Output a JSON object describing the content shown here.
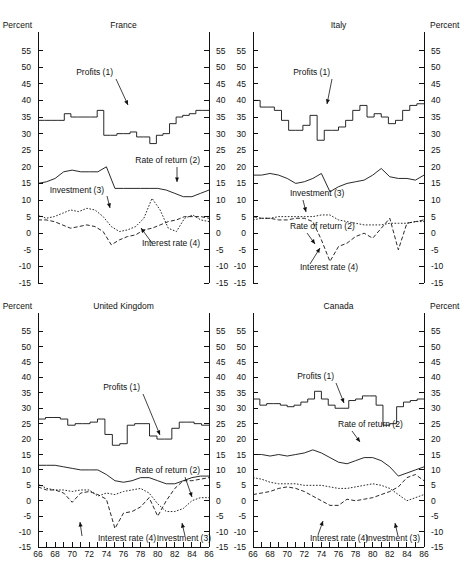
{
  "figure": {
    "left_axis_header": "Percent",
    "right_axis_header": "Percent"
  },
  "chart_data": [
    {
      "type": "line",
      "title": "France",
      "panel": "top-left",
      "xlabel": "",
      "ylabel": "Percent",
      "xlim": [
        66,
        86
      ],
      "ylim": [
        -15,
        57
      ],
      "grid": false,
      "legend_position": "inline-annotations",
      "yticks": [
        55,
        50,
        45,
        40,
        35,
        30,
        25,
        20,
        15,
        10,
        5,
        0,
        -5,
        -10,
        -15
      ],
      "xticks": [
        66,
        67,
        68,
        69,
        70,
        71,
        72,
        73,
        74,
        75,
        76,
        77,
        78,
        79,
        80,
        81,
        82,
        83,
        84,
        85,
        86
      ],
      "xticklabels": [
        "66",
        "68",
        "70",
        "72",
        "74",
        "76",
        "78",
        "80",
        "82",
        "84",
        "86"
      ],
      "x": [
        66,
        67,
        68,
        69,
        70,
        71,
        72,
        73,
        74,
        75,
        76,
        77,
        78,
        79,
        80,
        81,
        82,
        83,
        84,
        85,
        86
      ],
      "series": [
        {
          "name": "Profits (1)",
          "style": "step-solid",
          "values": [
            34,
            34,
            34,
            34,
            36,
            35,
            35,
            35,
            35,
            37,
            29.5,
            29.5,
            30,
            30,
            30.5,
            29,
            29,
            27,
            29.5,
            30,
            33,
            35,
            35.5,
            36,
            37,
            37
          ]
        },
        {
          "name": "Rate of return (2)",
          "style": "solid",
          "values": [
            15,
            15.5,
            16.5,
            18.5,
            19,
            18.5,
            18.5,
            18.5,
            20,
            13.5,
            13.5,
            13.5,
            13.5,
            13.5,
            13.5,
            13,
            12,
            11,
            11,
            12,
            13
          ]
        },
        {
          "name": "Investment (3)",
          "style": "dotted",
          "values": [
            5.5,
            4.5,
            5,
            6,
            7,
            6.5,
            7.5,
            7,
            5,
            2,
            0.5,
            1,
            2,
            4.5,
            10.5,
            7,
            1.5,
            0.5,
            4.5,
            5.5,
            4,
            3.5
          ]
        },
        {
          "name": "Interest rate (4)",
          "style": "dashed",
          "values": [
            4,
            4,
            3.5,
            2.5,
            1.5,
            2,
            2.5,
            2,
            0.5,
            -3.5,
            -2,
            -1,
            -0.5,
            1,
            1.5,
            2.5,
            3.5,
            4,
            5,
            5,
            5,
            4.5
          ]
        }
      ]
    },
    {
      "type": "line",
      "title": "Italy",
      "panel": "top-right",
      "xlabel": "",
      "ylabel": "Percent",
      "xlim": [
        66,
        86
      ],
      "ylim": [
        -15,
        57
      ],
      "grid": false,
      "legend_position": "inline-annotations",
      "yticks": [
        55,
        50,
        45,
        40,
        35,
        30,
        25,
        20,
        15,
        10,
        5,
        0,
        -5,
        -10,
        -15
      ],
      "xticks": [
        66,
        67,
        68,
        69,
        70,
        71,
        72,
        73,
        74,
        75,
        76,
        77,
        78,
        79,
        80,
        81,
        82,
        83,
        84,
        85,
        86
      ],
      "xticklabels": [
        "66",
        "68",
        "70",
        "72",
        "74",
        "76",
        "78",
        "80",
        "82",
        "84",
        "86"
      ],
      "x": [
        66,
        67,
        68,
        69,
        70,
        71,
        72,
        73,
        74,
        75,
        76,
        77,
        78,
        79,
        80,
        81,
        82,
        83,
        84,
        85,
        86
      ],
      "series": [
        {
          "name": "Profits (1)",
          "style": "step-solid",
          "values": [
            40,
            38,
            38,
            37,
            34,
            31,
            31,
            32.5,
            35.5,
            28,
            31,
            31,
            32,
            34,
            37,
            38.5,
            35,
            36,
            35,
            33,
            34,
            37,
            38.5,
            39
          ]
        },
        {
          "name": "Rate of return (2)",
          "style": "solid",
          "values": [
            17.5,
            17.5,
            18,
            17.5,
            16.5,
            15,
            15.5,
            16.5,
            18,
            12.5,
            14,
            15,
            15.5,
            16,
            17.5,
            19.5,
            17,
            16.5,
            16.5,
            16,
            17.5
          ]
        },
        {
          "name": "Investment (3)",
          "style": "dotted",
          "values": [
            4,
            4.5,
            4.5,
            5,
            5,
            5,
            5,
            5,
            5.5,
            5.5,
            4,
            3.5,
            3,
            2.5,
            2.5,
            2.5,
            3,
            3,
            3,
            3.5,
            3.5
          ]
        },
        {
          "name": "Interest rate (4)",
          "style": "dashed",
          "values": [
            5,
            4.5,
            4.5,
            4,
            4,
            4.5,
            4.5,
            3.5,
            -2,
            -8.5,
            -4,
            -3,
            -1,
            0,
            -1.5,
            1.5,
            4.5,
            -5,
            3,
            3.5,
            4
          ]
        }
      ]
    },
    {
      "type": "line",
      "title": "United Kingdom",
      "panel": "bottom-left",
      "xlabel": "",
      "ylabel": "Percent",
      "xlim": [
        66,
        86
      ],
      "ylim": [
        -15,
        57
      ],
      "grid": false,
      "legend_position": "inline-annotations",
      "yticks": [
        55,
        50,
        45,
        40,
        35,
        30,
        25,
        20,
        15,
        10,
        5,
        0,
        -5,
        -10,
        -15
      ],
      "xticks": [
        66,
        67,
        68,
        69,
        70,
        71,
        72,
        73,
        74,
        75,
        76,
        77,
        78,
        79,
        80,
        81,
        82,
        83,
        84,
        85,
        86
      ],
      "xticklabels": [
        "66",
        "68",
        "70",
        "72",
        "74",
        "76",
        "78",
        "80",
        "82",
        "84",
        "86"
      ],
      "x": [
        66,
        67,
        68,
        69,
        70,
        71,
        72,
        73,
        74,
        75,
        76,
        77,
        78,
        79,
        80,
        81,
        82,
        83,
        84,
        85,
        86
      ],
      "series": [
        {
          "name": "Profits (1)",
          "style": "step-solid",
          "values": [
            26.5,
            27,
            27,
            26.5,
            24.5,
            25,
            25,
            25.5,
            26.5,
            21.5,
            18,
            18.5,
            24.5,
            25,
            25,
            21,
            20,
            20,
            23.5,
            25.5,
            25.5,
            25,
            24.5
          ]
        },
        {
          "name": "Rate of return (2)",
          "style": "solid",
          "values": [
            11.5,
            11.5,
            11.5,
            11,
            10.5,
            10,
            10,
            10,
            8.5,
            6.5,
            6,
            6.5,
            7.5,
            7.5,
            6.5,
            5.5,
            5.5,
            6.5,
            7.5,
            8,
            8
          ]
        },
        {
          "name": "Investment (3)",
          "style": "dotted",
          "values": [
            5.5,
            4,
            3.5,
            3.5,
            3,
            3.5,
            3.5,
            1.5,
            2.5,
            2,
            3,
            3.5,
            4,
            2.5,
            -1,
            -3.5,
            -3.5,
            -2.5,
            0,
            1,
            1
          ]
        },
        {
          "name": "Interest rate (4)",
          "style": "dashed",
          "values": [
            4.5,
            3.5,
            3.5,
            2.5,
            -0.5,
            2.5,
            3,
            2,
            0.5,
            -9,
            -4,
            -3.5,
            -2,
            1,
            -5,
            0,
            4,
            6.5,
            6.5,
            7,
            7.5
          ]
        }
      ]
    },
    {
      "type": "line",
      "title": "Canada",
      "panel": "bottom-right",
      "xlabel": "",
      "ylabel": "Percent",
      "xlim": [
        66,
        86
      ],
      "ylim": [
        -15,
        57
      ],
      "grid": false,
      "legend_position": "inline-annotations",
      "yticks": [
        55,
        50,
        45,
        40,
        35,
        30,
        25,
        20,
        15,
        10,
        5,
        0,
        -5,
        -10,
        -15
      ],
      "xticks": [
        66,
        67,
        68,
        69,
        70,
        71,
        72,
        73,
        74,
        75,
        76,
        77,
        78,
        79,
        80,
        81,
        82,
        83,
        84,
        85,
        86
      ],
      "xticklabels": [
        "66",
        "68",
        "70",
        "72",
        "74",
        "76",
        "78",
        "80",
        "82",
        "84",
        "86"
      ],
      "x": [
        66,
        67,
        68,
        69,
        70,
        71,
        72,
        73,
        74,
        75,
        76,
        77,
        78,
        79,
        80,
        81,
        82,
        83,
        84,
        85,
        86
      ],
      "series": [
        {
          "name": "Profits (1)",
          "style": "step-solid",
          "values": [
            33,
            31,
            31.5,
            31.5,
            31,
            30.5,
            31,
            32,
            33,
            35.5,
            33,
            31,
            30,
            30,
            32.5,
            33,
            34,
            34,
            31,
            24.5,
            25,
            30.5,
            32,
            32.5,
            33
          ]
        },
        {
          "name": "Rate of return (2)",
          "style": "solid",
          "values": [
            15,
            15,
            14.5,
            15,
            14.5,
            15,
            15.5,
            16.5,
            15.5,
            14,
            12.5,
            12,
            13,
            14,
            14,
            13,
            11,
            8,
            9,
            10,
            11
          ]
        },
        {
          "name": "Investment (3)",
          "style": "dotted",
          "values": [
            7.5,
            7,
            6,
            5.5,
            5.5,
            5.5,
            5,
            5,
            5,
            4.5,
            4,
            4,
            4.5,
            5,
            5.5,
            5,
            4,
            2,
            0,
            1,
            2
          ]
        },
        {
          "name": "Interest rate (4)",
          "style": "dashed",
          "values": [
            2,
            2.5,
            3,
            4,
            4.5,
            4,
            3,
            1.5,
            0,
            -1.5,
            -1.5,
            0.5,
            0,
            0.5,
            1,
            2,
            3,
            4.5,
            7.5,
            8.5,
            6.5
          ]
        }
      ]
    }
  ],
  "annotations": {
    "france": [
      {
        "label": "Profits (1)"
      },
      {
        "label": "Rate of return (2)"
      },
      {
        "label": "Investment (3)"
      },
      {
        "label": "Interest rate (4)"
      }
    ],
    "italy": [
      {
        "label": "Profits (1)"
      },
      {
        "label": "Rate of return (2)"
      },
      {
        "label": "Investment (3)"
      },
      {
        "label": "Interest rate (4)"
      }
    ],
    "uk": [
      {
        "label": "Profits (1)"
      },
      {
        "label": "Rate of return (2)"
      },
      {
        "label": "Investment (3)"
      },
      {
        "label": "Interest rate (4)"
      }
    ],
    "canada": [
      {
        "label": "Profits (1)"
      },
      {
        "label": "Rate of return (2)"
      },
      {
        "label": "Investment (3)"
      },
      {
        "label": "Interest rate (4)"
      }
    ]
  }
}
